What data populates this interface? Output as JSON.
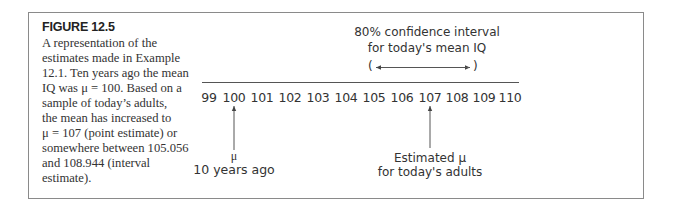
{
  "figure": {
    "title": "FIGURE 12.5",
    "caption_lines": [
      "A representation of the",
      "estimates made in Example",
      "12.1. Ten years ago the mean",
      "IQ was μ = 100. Based on a",
      "sample of today’s adults,",
      "the mean has increased to",
      "μ = 107 (point estimate) or",
      "somewhere between 105.056",
      "and 108.944 (interval",
      "estimate)."
    ]
  },
  "diagram": {
    "interval_label_lines": [
      "80% confidence interval",
      "for today's mean IQ"
    ],
    "interval_open": "(",
    "interval_close": ")",
    "axis_ticks": [
      "99",
      "100",
      "101",
      "102",
      "103",
      "104",
      "105",
      "106",
      "107",
      "108",
      "109",
      "110"
    ],
    "past_mean": {
      "symbol": "μ",
      "label": "10 years ago",
      "value": "100"
    },
    "estimated_mean": {
      "line1": "Estimated μ",
      "line2": "for today's adults",
      "value": "107"
    },
    "interval_bounds": {
      "lower": "105.056",
      "upper": "108.944"
    }
  },
  "colors": {
    "border": "#8a8a8a",
    "text": "#333333",
    "line": "#555555"
  }
}
